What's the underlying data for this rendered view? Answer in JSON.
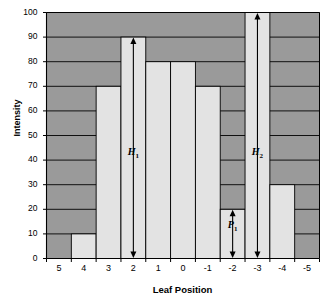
{
  "chart_data": {
    "type": "bar",
    "title": "",
    "xlabel": "Leaf Position",
    "ylabel": "Intensity",
    "categories": [
      "5",
      "4",
      "3",
      "2",
      "1",
      "0",
      "-1",
      "-2",
      "-3",
      "-4",
      "-5"
    ],
    "values": [
      0,
      10,
      70,
      90,
      80,
      80,
      70,
      20,
      100,
      30,
      0
    ],
    "ylim": [
      0,
      100
    ],
    "ytick_labels": [
      "0",
      "10",
      "20",
      "30",
      "40",
      "50",
      "60",
      "70",
      "80",
      "90",
      "100"
    ],
    "ytick_values": [
      0,
      10,
      20,
      30,
      40,
      50,
      60,
      70,
      80,
      90,
      100
    ],
    "grid": true,
    "legend": "none",
    "plot_background_color": "#9a9a9a",
    "bar_color": "#e3e3e3",
    "bar_border_color": "#000000",
    "gridline_color": "#000000",
    "annotations": [
      {
        "name": "H1",
        "label": "H",
        "subscript": "1",
        "category": "2",
        "from_value": 0,
        "to_value": 90,
        "arrow": "double"
      },
      {
        "name": "P1",
        "label": "P",
        "subscript": "1",
        "category": "-2",
        "from_value": 0,
        "to_value": 20,
        "arrow": "double"
      },
      {
        "name": "H2",
        "label": "H",
        "subscript": "2",
        "category": "-3",
        "from_value": 0,
        "to_value": 100,
        "arrow": "double"
      }
    ]
  }
}
